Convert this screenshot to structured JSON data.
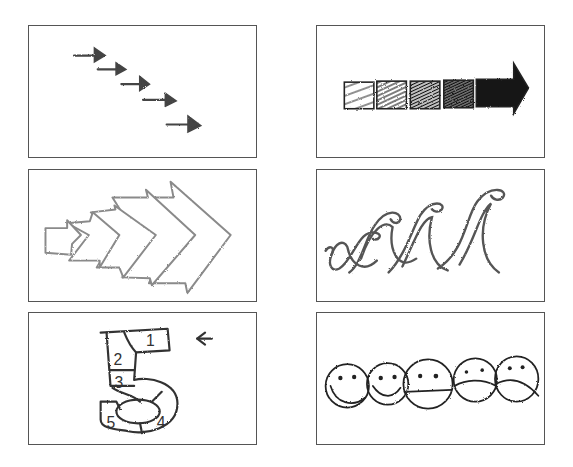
{
  "figure": {
    "layout": {
      "rows": 3,
      "cols": 2,
      "background": "#ffffff",
      "border_color": "#555555"
    },
    "panels": [
      {
        "id": "p1",
        "label": "staggered-arrows",
        "description": "Five small hand-drawn arrows descending diagonally to the right",
        "stroke": "#444444",
        "count": 5
      },
      {
        "id": "p2",
        "label": "gradient-squares-arrow",
        "description": "Row of five hatched squares growing darker, last one is a solid arrow",
        "stroke": "#222222",
        "count": 5
      },
      {
        "id": "p3",
        "label": "growing-chevron-arrows",
        "description": "Overlapping chevron arrows increasing in size from left to right",
        "stroke": "#888888",
        "count": 5
      },
      {
        "id": "p4",
        "label": "growing-waves",
        "description": "Four crayon wave curls increasing in height",
        "stroke": "#555555",
        "count": 4
      },
      {
        "id": "p5",
        "label": "numbered-five-path",
        "description": "Digit 5 divided into numbered segments with an entry arrow",
        "stroke": "#333333",
        "segments": [
          "1",
          "2",
          "3",
          "4",
          "5"
        ],
        "arrow": "←"
      },
      {
        "id": "p6",
        "label": "mood-faces",
        "description": "Five faces transitioning from happy to sad",
        "stroke": "#222222",
        "faces": [
          "happy",
          "slightly-happy",
          "neutral",
          "slightly-sad",
          "sad"
        ]
      }
    ]
  }
}
